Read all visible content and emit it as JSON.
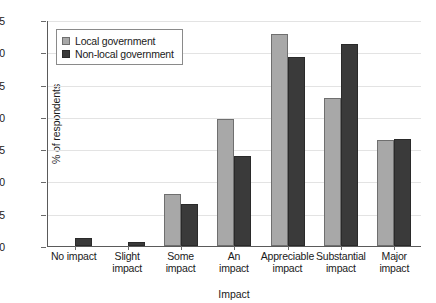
{
  "chart_data": {
    "type": "bar",
    "title": "",
    "xlabel": "Impact",
    "ylabel": "% of respondents",
    "ylim": [
      0,
      35
    ],
    "ytick_step": 5,
    "yticks": [
      "0",
      "5",
      "10",
      "15",
      "20",
      "25",
      "30",
      "35"
    ],
    "grid": true,
    "legend_position": "upper-left-inside",
    "categories": [
      "No impact",
      "Slight impact",
      "Some impact",
      "An impact",
      "Appreciable impact",
      "Substantial impact",
      "Major impact"
    ],
    "category_lines": [
      [
        "No impact"
      ],
      [
        "Slight",
        "impact"
      ],
      [
        "Some",
        "impact"
      ],
      [
        "An",
        "impact"
      ],
      [
        "Appreciable",
        "impact"
      ],
      [
        "Substantial",
        "impact"
      ],
      [
        "Major",
        "impact"
      ]
    ],
    "series": [
      {
        "name": "Local government",
        "color": "#a8a8a8",
        "values": [
          0,
          0,
          8.1,
          19.7,
          32.9,
          22.9,
          16.4
        ]
      },
      {
        "name": "Non-local government",
        "color": "#3a3a3a",
        "values": [
          1.3,
          0.6,
          6.5,
          14.0,
          29.3,
          31.3,
          16.6
        ]
      }
    ]
  },
  "legend": {
    "items": [
      {
        "label": "Local government",
        "swatch": "light"
      },
      {
        "label": "Non-local government",
        "swatch": "dark"
      }
    ]
  },
  "colors": {
    "local": "#a8a8a8",
    "nonlocal": "#3a3a3a",
    "axis": "#5a5a5a",
    "grid": "#e3e3e3",
    "background": "#ffffff"
  }
}
